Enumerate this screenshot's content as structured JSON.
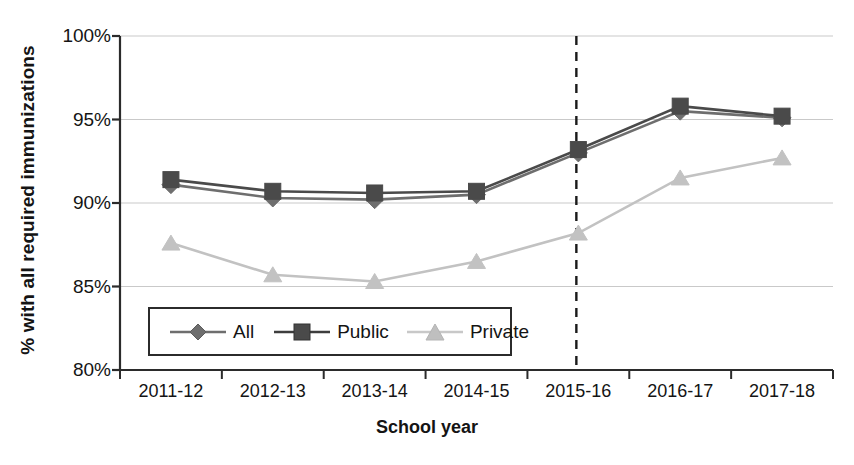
{
  "chart_data": {
    "type": "line",
    "title": "",
    "xlabel": "School year",
    "ylabel": "% with all required immunizations",
    "categories": [
      "2011-12",
      "2012-13",
      "2013-14",
      "2014-15",
      "2015-16",
      "2016-17",
      "2017-18"
    ],
    "ylim": [
      80,
      100
    ],
    "ytick_labels": [
      "80%",
      "85%",
      "90%",
      "95%",
      "100%"
    ],
    "ytick_values": [
      80,
      85,
      90,
      95,
      100
    ],
    "grid": true,
    "legend_position": "lower-left-inside",
    "series": [
      {
        "name": "All",
        "marker": "diamond",
        "color": "#6e6e6e",
        "values": [
          91.1,
          90.3,
          90.2,
          90.5,
          93.0,
          95.5,
          95.1
        ]
      },
      {
        "name": "Public",
        "marker": "square",
        "color": "#4a4a4a",
        "values": [
          91.4,
          90.7,
          90.6,
          90.7,
          93.2,
          95.8,
          95.2
        ]
      },
      {
        "name": "Private",
        "marker": "triangle",
        "color": "#c2c2c2",
        "values": [
          87.6,
          85.7,
          85.3,
          86.5,
          88.2,
          91.5,
          92.7
        ]
      }
    ],
    "annotations": [
      {
        "type": "vertical-dashed-line",
        "at_category": "2015-16",
        "label": ""
      }
    ]
  },
  "legend": {
    "items": [
      {
        "label": "All",
        "marker": "diamond-marker-icon"
      },
      {
        "label": "Public",
        "marker": "square-marker-icon"
      },
      {
        "label": "Private",
        "marker": "triangle-marker-icon"
      }
    ]
  }
}
